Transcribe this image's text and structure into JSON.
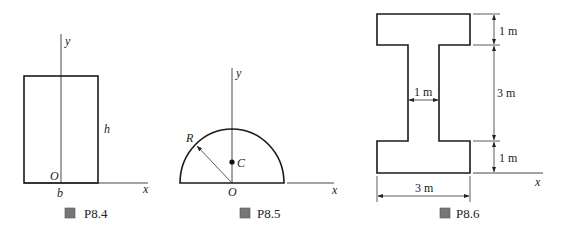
{
  "figures": [
    {
      "id": "P8.4",
      "caption_prefix": "圖",
      "caption": "P8.4",
      "labels": {
        "y_axis": "y",
        "x_axis": "x",
        "origin": "O",
        "width": "b",
        "height": "h"
      }
    },
    {
      "id": "P8.5",
      "caption_prefix": "圖",
      "caption": "P8.5",
      "labels": {
        "y_axis": "y",
        "x_axis": "x",
        "origin": "O",
        "radius": "R",
        "centroid": "C"
      }
    },
    {
      "id": "P8.6",
      "caption_prefix": "圖",
      "caption": "P8.6",
      "labels": {
        "x_axis": "x",
        "top_flange_thickness": "1 m",
        "web_height": "3 m",
        "bottom_flange_thickness": "1 m",
        "web_width": "1 m",
        "flange_width": "3 m"
      }
    }
  ]
}
